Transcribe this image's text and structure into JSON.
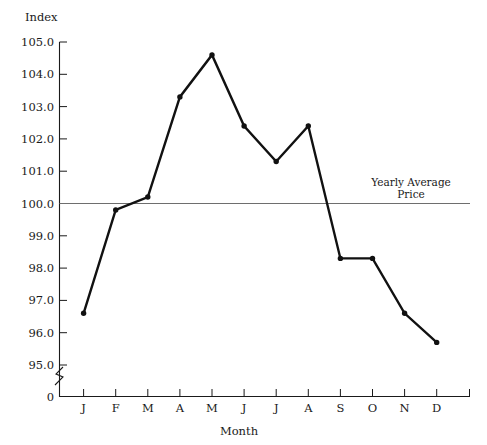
{
  "chart_data": {
    "type": "line",
    "title": "",
    "ylabel": "Index",
    "xlabel": "Month",
    "categories": [
      "J",
      "F",
      "M",
      "A",
      "M",
      "J",
      "J",
      "A",
      "S",
      "O",
      "N",
      "D"
    ],
    "category_names": [
      "January",
      "February",
      "March",
      "April",
      "May",
      "June",
      "July",
      "August",
      "September",
      "October",
      "November",
      "December"
    ],
    "values": [
      96.6,
      99.8,
      100.2,
      103.3,
      104.6,
      102.4,
      101.3,
      102.4,
      98.3,
      98.3,
      96.6,
      95.7
    ],
    "series": [
      {
        "name": "Index",
        "values": [
          96.6,
          99.8,
          100.2,
          103.3,
          104.6,
          102.4,
          101.3,
          102.4,
          98.3,
          98.3,
          96.6,
          95.7
        ]
      }
    ],
    "ytick_labels": [
      "105.0",
      "104.0",
      "103.0",
      "102.0",
      "101.0",
      "100.0",
      "99.0",
      "98.0",
      "97.0",
      "96.0",
      "95.0",
      "0"
    ],
    "ytick_values": [
      105.0,
      104.0,
      103.0,
      102.0,
      101.0,
      100.0,
      99.0,
      98.0,
      97.0,
      96.0,
      95.0
    ],
    "zero_tick_label": "0",
    "ylim": [
      95.0,
      105.0
    ],
    "axis_break": true,
    "grid": false,
    "legend": "none",
    "annotations": [
      {
        "name": "yearly-average-price",
        "line1": "Yearly Average",
        "line2": "Price",
        "value": 100.0
      }
    ],
    "colors": {
      "series": "#111111",
      "reference_line": "#6e6e6e",
      "axis": "#1a1a1a",
      "background": "#ffffff"
    }
  }
}
